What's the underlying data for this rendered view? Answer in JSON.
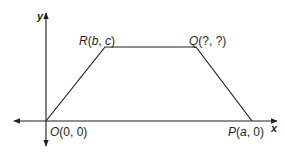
{
  "diagram": {
    "type": "coordinate-plane-trapezoid",
    "axes": {
      "x_label": "x",
      "y_label": "y"
    },
    "points": [
      {
        "id": "O",
        "name": "O",
        "coords": "(0, 0)",
        "px": [
          46,
          121
        ]
      },
      {
        "id": "R",
        "name": "R",
        "coords": "(b, c)",
        "px": [
          105,
          47
        ]
      },
      {
        "id": "Q",
        "name": "Q",
        "coords": "(?, ?)",
        "px": [
          196,
          47
        ]
      },
      {
        "id": "P",
        "name": "P",
        "coords": "(a, 0)",
        "px": [
          252,
          121
        ]
      }
    ],
    "labels": {
      "O": {
        "letter": "O",
        "rest": "(0, 0)"
      },
      "R": {
        "letter": "R",
        "open": "(",
        "a": "b",
        "sep": ", ",
        "b": "c",
        "close": ")"
      },
      "Q": {
        "letter": "Q",
        "rest": "(?, ?)"
      },
      "P": {
        "letter": "P",
        "open": "(",
        "a": "a",
        "rest": ", 0)"
      }
    },
    "colors": {
      "line": "#231f20",
      "background": "#ffffff"
    }
  }
}
